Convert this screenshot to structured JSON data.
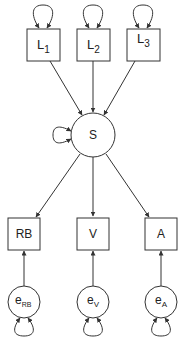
{
  "diagram": {
    "type": "path-diagram",
    "colors": {
      "stroke": "#333333",
      "text": "#222222",
      "background": "#ffffff"
    },
    "nodes": {
      "L1": {
        "label": "L",
        "sub": "1",
        "shape": "rect"
      },
      "L2": {
        "label": "L",
        "sub": "2",
        "shape": "rect"
      },
      "L3": {
        "label": "L",
        "sub": "3",
        "shape": "rect"
      },
      "S": {
        "label": "S",
        "shape": "circle"
      },
      "RB": {
        "label": "RB",
        "shape": "rect"
      },
      "V": {
        "label": "V",
        "shape": "rect"
      },
      "A": {
        "label": "A",
        "shape": "rect"
      },
      "eRB": {
        "label": "e",
        "sub": "RB",
        "shape": "circle"
      },
      "eV": {
        "label": "e",
        "sub": "V",
        "shape": "circle"
      },
      "eA": {
        "label": "e",
        "sub": "A",
        "shape": "circle"
      }
    },
    "edges": [
      {
        "from": "L1",
        "to": "S"
      },
      {
        "from": "L2",
        "to": "S"
      },
      {
        "from": "L3",
        "to": "S"
      },
      {
        "from": "S",
        "to": "RB"
      },
      {
        "from": "S",
        "to": "V"
      },
      {
        "from": "S",
        "to": "A"
      },
      {
        "from": "eRB",
        "to": "RB"
      },
      {
        "from": "eV",
        "to": "V"
      },
      {
        "from": "eA",
        "to": "A"
      }
    ],
    "self_loops": [
      "L1",
      "L2",
      "L3",
      "S",
      "eRB",
      "eV",
      "eA"
    ]
  }
}
